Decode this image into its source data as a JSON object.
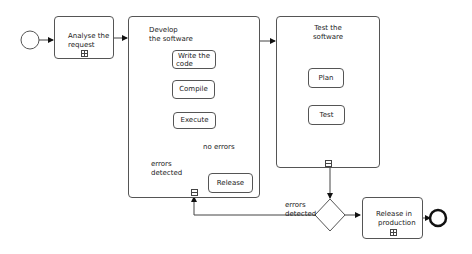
{
  "diagram": {
    "type": "bpmn-process",
    "nodes": {
      "start": {
        "kind": "start-event"
      },
      "analyse": {
        "label_line1": "Analyse the",
        "label_line2": "request",
        "kind": "collapsed-subprocess"
      },
      "develop": {
        "label_line1": "Develop",
        "label_line2": "the software",
        "kind": "expanded-subprocess"
      },
      "write": {
        "label_line1": "Write the",
        "label_line2": "code",
        "kind": "task"
      },
      "compile": {
        "label": "Compile",
        "kind": "task"
      },
      "execute": {
        "label": "Execute",
        "kind": "task"
      },
      "inner_gateway": {
        "kind": "exclusive-gateway"
      },
      "release": {
        "label": "Release",
        "kind": "task"
      },
      "test_sw": {
        "label_line1": "Test the",
        "label_line2": "software",
        "kind": "expanded-subprocess"
      },
      "test_start": {
        "kind": "start-event"
      },
      "plan": {
        "label": "Plan",
        "kind": "task"
      },
      "test": {
        "label": "Test",
        "kind": "task"
      },
      "test_end": {
        "kind": "end-event"
      },
      "outer_gateway": {
        "kind": "exclusive-gateway"
      },
      "release_prod": {
        "label_line1": "Release in",
        "label_line2": "production",
        "kind": "collapsed-subprocess"
      },
      "end": {
        "kind": "end-event"
      }
    },
    "edge_labels": {
      "no_errors": "no errors",
      "inner_errors_line1": "errors",
      "inner_errors_line2": "detected",
      "outer_errors_line1": "errors",
      "outer_errors_line2": "detected"
    },
    "colors": {
      "stroke": "#555555",
      "text": "#222222",
      "background": "#ffffff"
    }
  }
}
